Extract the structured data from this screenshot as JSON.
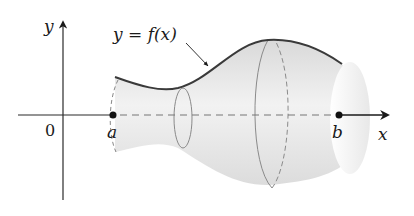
{
  "figure": {
    "labels": {
      "y_axis": "y",
      "x_axis": "x",
      "origin": "0",
      "point_a": "a",
      "point_b": "b",
      "curve": "y = f(x)"
    },
    "colors": {
      "axis": "#2a2a2a",
      "curve": "#3a3a3a",
      "solid_fill": "#e6e6e6",
      "dashed": "#777777"
    }
  }
}
